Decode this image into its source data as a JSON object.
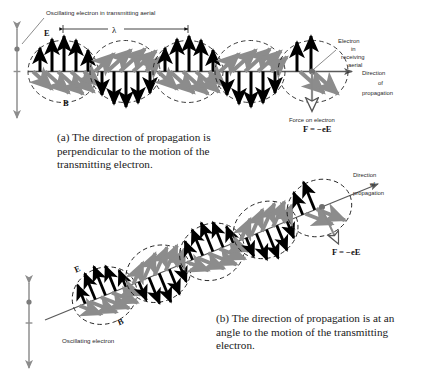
{
  "figure": {
    "background_color": "#ffffff",
    "panel_a": {
      "label_oscillating": "Oscillating electron  in  transmitting  aerial",
      "label_wavelength": "λ",
      "label_E": "E",
      "label_B": "B",
      "label_receiving_1": "Electron",
      "label_receiving_2": "in",
      "label_receiving_3": "receiving",
      "label_receiving_4": "aerial",
      "label_direction_1": "Direction",
      "label_direction_2": "of",
      "label_direction_3": "propagation",
      "label_force": "Force on electron",
      "label_force_formula": "F = −eE"
    },
    "panel_b": {
      "label_direction_1": "Direction",
      "label_direction_2": "of",
      "label_direction_3": "propagation",
      "label_E": "E",
      "label_B": "B",
      "label_oscillating": "Oscillating electron",
      "label_force_formula": "F = −eE"
    },
    "colors": {
      "e_field_arrow": "#000000",
      "b_field_arrow": "#8c8c8c",
      "axis": "#4d4d4d",
      "envelope_dash": "#1a1a1a",
      "text": "#2a2a2a"
    }
  },
  "captions": {
    "a": "(a)  The direction of propagation is perpendicular to the motion of the transmitting electron.",
    "b": "(b)  The direction of propagation is at an angle to the motion of the transmitting electron."
  }
}
